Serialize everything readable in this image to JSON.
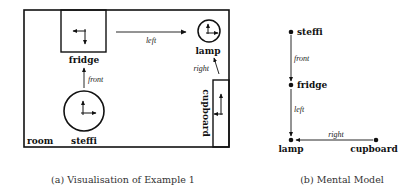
{
  "panel_a": {
    "caption": "(a) Visualisation of Example 1",
    "objects": {
      "room": "room",
      "fridge": "fridge",
      "lamp": "lamp",
      "steffi": "steffi",
      "cupboard": "cupboard"
    },
    "relations": {
      "left": "left",
      "right": "right",
      "front": "front"
    }
  },
  "panel_b": {
    "caption": "(b) Mental Model",
    "nodes": {
      "steffi": "steffi",
      "fridge": "fridge",
      "lamp": "lamp",
      "cupboard": "cupboard"
    },
    "edges": {
      "front": "front",
      "left": "left",
      "right": "right"
    }
  }
}
